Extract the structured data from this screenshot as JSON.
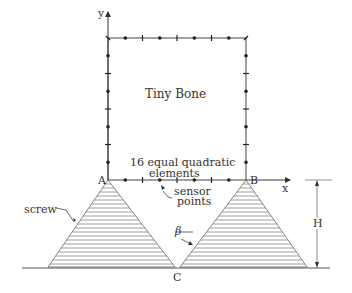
{
  "diagram": {
    "title": "Tiny Bone",
    "elements_note_line1": "16 equal quadratic",
    "elements_note_line2": "elements",
    "sensor_line1": "sensor",
    "sensor_line2": "points",
    "screw_label": "screw",
    "angle_label": "β",
    "point_a": "A",
    "point_b": "B",
    "point_c": "C",
    "axis_x": "x",
    "axis_y": "y",
    "height_label": "H",
    "line_color": "#333333"
  }
}
